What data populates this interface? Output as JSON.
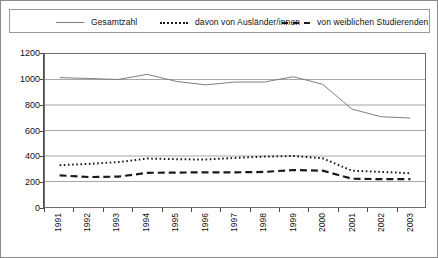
{
  "legend": {
    "entries": [
      {
        "label": "Gesamtzahl",
        "style": "solid",
        "color": "#7d7d7d"
      },
      {
        "label": "davon von Ausländer/innen",
        "style": "dotted",
        "color": "#1a1a1a"
      },
      {
        "label": "von weiblichen Studierenden",
        "style": "dashed",
        "color": "#1a1a1a"
      }
    ]
  },
  "axes": {
    "y_ticks": [
      "0",
      "200",
      "400",
      "600",
      "800",
      "1000",
      "1200"
    ],
    "x_ticks": [
      "1991",
      "1992",
      "1993",
      "1994",
      "1995",
      "1996",
      "1997",
      "1998",
      "1999",
      "2000",
      "2001",
      "2002",
      "2003"
    ]
  },
  "chart_data": {
    "type": "line",
    "title": "",
    "xlabel": "",
    "ylabel": "",
    "ylim": [
      0,
      1200
    ],
    "ytick_step": 200,
    "grid": true,
    "legend_position": "top",
    "categories": [
      "1991",
      "1992",
      "1993",
      "1994",
      "1995",
      "1996",
      "1997",
      "1998",
      "1999",
      "2000",
      "2001",
      "2002",
      "2003"
    ],
    "series": [
      {
        "name": "Gesamtzahl",
        "style": "solid",
        "color": "#7d7d7d",
        "values": [
          1015,
          1008,
          1000,
          1040,
          985,
          958,
          980,
          980,
          1022,
          962,
          768,
          708,
          698
        ]
      },
      {
        "name": "davon von Ausländer/innen",
        "style": "dotted",
        "color": "#1a1a1a",
        "values": [
          328,
          338,
          352,
          380,
          375,
          372,
          385,
          395,
          400,
          382,
          285,
          275,
          265
        ]
      },
      {
        "name": "von weiblichen Studierenden",
        "style": "dashed",
        "color": "#1a1a1a",
        "values": [
          248,
          235,
          238,
          268,
          270,
          272,
          272,
          275,
          290,
          285,
          222,
          218,
          218
        ]
      }
    ]
  }
}
